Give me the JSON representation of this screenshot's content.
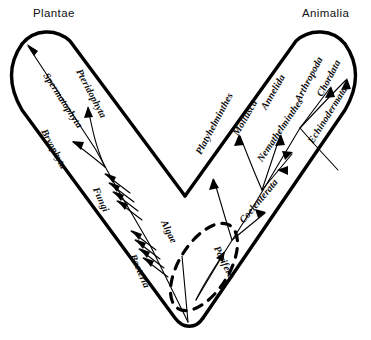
{
  "figure": {
    "type": "phylogenetic-tree-diagram",
    "shape": "v-shaped two-lobed tree",
    "background_color": "#ffffff",
    "line_color": "#000000",
    "kingdoms": [
      {
        "id": "plantae",
        "label": "Plantae",
        "side": "left"
      },
      {
        "id": "animalia",
        "label": "Animalia",
        "side": "right"
      }
    ],
    "taxa": [
      {
        "id": "spermatophyta",
        "label": "Spermatophyta",
        "branch": "plantae",
        "x": 46,
        "y": 68,
        "rotation": 57
      },
      {
        "id": "pteridophyta",
        "label": "Pteridophyta",
        "branch": "plantae",
        "x": 79,
        "y": 64,
        "rotation": 62
      },
      {
        "id": "bryophyta",
        "label": "Bryophyta",
        "branch": "plantae",
        "x": 44,
        "y": 124,
        "rotation": 62
      },
      {
        "id": "fungi",
        "label": "Fungi",
        "branch": "plantae",
        "x": 96,
        "y": 182,
        "rotation": 66
      },
      {
        "id": "bacteria",
        "label": "Bacteria",
        "branch": "plantae",
        "x": 133,
        "y": 249,
        "rotation": 66
      },
      {
        "id": "algae",
        "label": "Algae",
        "branch": "base",
        "x": 164,
        "y": 215,
        "rotation": 64
      },
      {
        "id": "porifera",
        "label": "Porifera",
        "branch": "animalia",
        "x": 217,
        "y": 241,
        "rotation": 64
      },
      {
        "id": "platyhelminthes",
        "label": "Platyhelminthes",
        "branch": "animalia",
        "x": 198,
        "y": 148,
        "rotation": -62
      },
      {
        "id": "coelenterata",
        "label": "Coelenterata",
        "branch": "animalia",
        "x": 241,
        "y": 216,
        "rotation": -50
      },
      {
        "id": "mollusca",
        "label": "Mollusca",
        "branch": "animalia",
        "x": 235,
        "y": 129,
        "rotation": -60
      },
      {
        "id": "annelida",
        "label": "Annelida",
        "branch": "animalia",
        "x": 263,
        "y": 103,
        "rotation": -60
      },
      {
        "id": "nemathelminthes",
        "label": "Nemathelminthes",
        "branch": "animalia",
        "x": 259,
        "y": 155,
        "rotation": -56
      },
      {
        "id": "arthropoda",
        "label": "Arthropoda",
        "branch": "animalia",
        "x": 297,
        "y": 95,
        "rotation": -62
      },
      {
        "id": "chordata",
        "label": "Chordata",
        "branch": "animalia",
        "x": 319,
        "y": 90,
        "rotation": -62
      },
      {
        "id": "echinodermata",
        "label": "Echinodermata",
        "branch": "animalia",
        "x": 310,
        "y": 137,
        "rotation": -58
      }
    ],
    "annotations": {
      "dashed_region": "dashed oval at base enclosing Algae / Porifera origin"
    }
  }
}
